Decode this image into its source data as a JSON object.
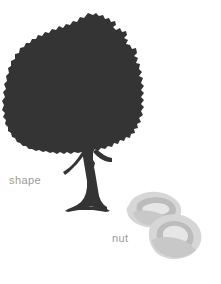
{
  "figure": {
    "background_color": "#ffffff",
    "labels": {
      "shape": "shape",
      "nut": "nut"
    },
    "label_color": "#9a9a9a",
    "tree": {
      "name": "tree-silhouette",
      "color": "#343434",
      "description": "dark solid silhouette of a broad-canopied tree with forked trunk"
    },
    "nuts": {
      "name": "nut-pair",
      "count": 2,
      "outer_shell_color": "#d4d4d4",
      "inner_kernel_color": "#bdbdbd",
      "highlight_color": "#e4e4e4",
      "description": "two overlapping pistachio-like nut shapes in light gray tones"
    }
  }
}
